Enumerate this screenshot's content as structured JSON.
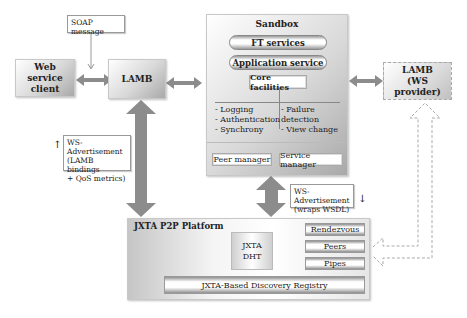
{
  "diagram": {
    "soap_callout": "SOAP message",
    "web_service_client": "Web service client",
    "lamb": "LAMB",
    "sandbox": {
      "title": "Sandbox",
      "ft_services": "FT services",
      "application_service": "Application service",
      "core_facilities": "Core facilities",
      "left_items": [
        "- Logging",
        "- Authentication",
        "- Synchrony"
      ],
      "right_items": [
        "- Failure detection",
        "- View change"
      ],
      "peer_manager": "Peer manager",
      "service_manager": "Service manager"
    },
    "lamb_provider": {
      "title": "LAMB",
      "subtitle": "(WS provider)"
    },
    "ws_ad_left": {
      "line1": "WS-Advertisement",
      "line2": "(LAMB bindings",
      "line3": "+ QoS metrics)",
      "arrow": "↑"
    },
    "ws_ad_right": {
      "line1": "WS-Advertisement",
      "line2": "(wraps WSDL)",
      "arrow": "↓"
    },
    "jxta": {
      "title": "JXTA P2P Platform",
      "dht_line1": "JXTA",
      "dht_line2": "DHT",
      "rendezvous": "Rendezvous",
      "peers": "Peers",
      "pipes": "Pipes",
      "registry": "JXTA-Based Discovery Registry"
    },
    "colors": {
      "arrow": "#8c8c8c",
      "dashed_arrow": "#b0b0b0"
    }
  }
}
